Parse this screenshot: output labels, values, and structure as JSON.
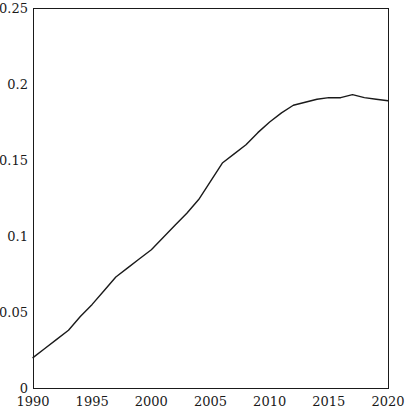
{
  "chart_data": {
    "type": "line",
    "title": "",
    "subtitle": "",
    "xlabel": "",
    "ylabel": "",
    "xlim": [
      1990,
      2020
    ],
    "ylim": [
      0,
      0.25
    ],
    "grid": false,
    "legend": null,
    "annotations": [],
    "xticks": [
      1990,
      1995,
      2000,
      2005,
      2010,
      2015,
      2020
    ],
    "xtick_labels": [
      "1990",
      "1995",
      "2000",
      "2005",
      "2010",
      "2015",
      "2020"
    ],
    "yticks": [
      0,
      0.05,
      0.1,
      0.15,
      0.2,
      0.25
    ],
    "ytick_labels": [
      "0",
      "0.05",
      "0.1",
      "0.15",
      "0.2",
      "0.25"
    ],
    "series": [
      {
        "name": "series-1",
        "color": "#1a1a1a",
        "line_width": 1.4,
        "x": [
          1990,
          1991,
          1992,
          1993,
          1994,
          1995,
          1996,
          1997,
          1998,
          1999,
          2000,
          2001,
          2002,
          2003,
          2004,
          2005,
          2006,
          2007,
          2008,
          2009,
          2010,
          2011,
          2012,
          2013,
          2014,
          2015,
          2016,
          2017,
          2018,
          2019,
          2020
        ],
        "y": [
          0.02,
          0.026,
          0.032,
          0.038,
          0.047,
          0.055,
          0.064,
          0.073,
          0.079,
          0.085,
          0.091,
          0.099,
          0.107,
          0.115,
          0.124,
          0.136,
          0.148,
          0.154,
          0.16,
          0.168,
          0.175,
          0.181,
          0.186,
          0.188,
          0.19,
          0.191,
          0.191,
          0.193,
          0.191,
          0.19,
          0.189
        ]
      }
    ]
  },
  "plot_frame": {
    "left": 33,
    "right": 388,
    "top": 8,
    "bottom": 388,
    "border_color": "#1a1a1a",
    "border_width": 1
  }
}
